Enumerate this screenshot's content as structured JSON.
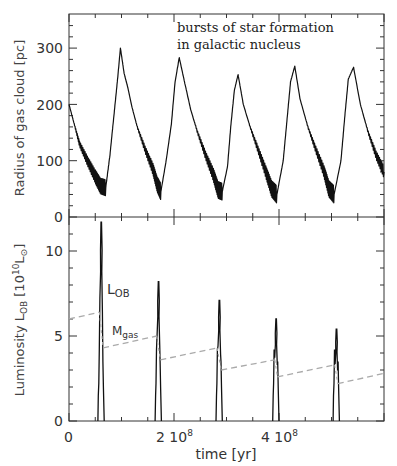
{
  "chart_data": [
    {
      "type": "line",
      "panel": "top",
      "title": "",
      "annotation": [
        "bursts of star formation",
        "in galactic nucleus"
      ],
      "xlabel": "",
      "ylabel": "Radius of gas cloud [pc]",
      "xlim": [
        0,
        600000000
      ],
      "ylim": [
        0,
        350
      ],
      "yticks": [
        0,
        100,
        200,
        300
      ],
      "ytick_labels": [
        "0",
        "100",
        "200",
        "300"
      ],
      "series": [
        {
          "name": "Radius of gas cloud",
          "style": "solid",
          "color": "#111111",
          "x_1e8": [
            0.0,
            0.1,
            0.2,
            0.35,
            0.5,
            0.6,
            0.7,
            0.78,
            0.85,
            0.92,
            0.98,
            1.05,
            1.12,
            1.2,
            1.3,
            1.45,
            1.6,
            1.68,
            1.75,
            1.85,
            1.95,
            2.02,
            2.1,
            2.2,
            2.32,
            2.45,
            2.6,
            2.75,
            2.84,
            2.92,
            3.02,
            3.08,
            3.15,
            3.22,
            3.32,
            3.45,
            3.6,
            3.75,
            3.86,
            3.96,
            4.08,
            4.15,
            4.22,
            4.3,
            4.4,
            4.55,
            4.7,
            4.86,
            4.95,
            5.05,
            5.18,
            5.25,
            5.32,
            5.42,
            5.55,
            5.7,
            5.85,
            6.0
          ],
          "y": [
            200,
            165,
            130,
            100,
            72,
            55,
            52,
            110,
            175,
            240,
            300,
            255,
            230,
            195,
            160,
            120,
            85,
            58,
            45,
            100,
            165,
            240,
            283,
            240,
            190,
            150,
            110,
            75,
            48,
            45,
            90,
            160,
            225,
            253,
            200,
            160,
            120,
            80,
            50,
            40,
            100,
            170,
            240,
            268,
            210,
            160,
            120,
            80,
            50,
            40,
            100,
            175,
            245,
            266,
            200,
            150,
            110,
            80
          ]
        }
      ]
    },
    {
      "type": "line",
      "panel": "bottom",
      "title": "",
      "xlabel": "time [yr]",
      "ylabel": "Luminosity L_OB [10^10 L_sun]",
      "xlim": [
        0,
        600000000
      ],
      "ylim": [
        0,
        12
      ],
      "xticks": [
        0,
        200000000,
        400000000
      ],
      "xtick_labels": [
        "0",
        "2 10^8",
        "4 10^8"
      ],
      "yticks": [
        0,
        5,
        10
      ],
      "ytick_labels": [
        "0",
        "5",
        "10"
      ],
      "series": [
        {
          "name": "L_OB",
          "style": "solid",
          "color": "#111111",
          "peaks_x_1e8": [
            0.61,
            1.7,
            2.86,
            3.94,
            5.09
          ],
          "peaks_y": [
            11.7,
            8.2,
            7.1,
            6.0,
            5.4
          ],
          "half_width_1e8": 0.06
        },
        {
          "name": "M_gas",
          "style": "dashed",
          "color": "#aaaaaa",
          "segments": [
            {
              "x_1e8": [
                0.0,
                0.58
              ],
              "y": [
                6.0,
                6.4
              ]
            },
            {
              "x_1e8": [
                0.65,
                1.67
              ],
              "y": [
                4.3,
                5.0
              ]
            },
            {
              "x_1e8": [
                1.74,
                2.82
              ],
              "y": [
                3.6,
                4.3
              ]
            },
            {
              "x_1e8": [
                2.9,
                3.92
              ],
              "y": [
                3.0,
                3.6
              ]
            },
            {
              "x_1e8": [
                3.97,
                5.06
              ],
              "y": [
                2.6,
                3.3
              ]
            },
            {
              "x_1e8": [
                5.12,
                6.0
              ],
              "y": [
                2.2,
                2.8
              ]
            }
          ]
        }
      ],
      "labels": {
        "lob": "L",
        "lob_sub": "OB",
        "mgas": "M",
        "mgas_sub": "gas"
      }
    }
  ],
  "axes": {
    "top_ylabel": "Radius of gas cloud [pc]",
    "bottom_ylabel_main": "Luminosity L",
    "bottom_ylabel_sub": "OB",
    "bottom_ylabel_unit_pre": "[10",
    "bottom_ylabel_unit_exp": "10",
    "bottom_ylabel_unit_L": "L",
    "bottom_ylabel_unit_sun": "⊙",
    "bottom_ylabel_unit_post": "]",
    "xlabel": "time [yr]",
    "xtick_0": "0",
    "xtick_2": "2 10",
    "xtick_4": "4 10",
    "xtick_exp": "8",
    "top_yticks": [
      "0",
      "100",
      "200",
      "300"
    ],
    "bottom_yticks": [
      "0",
      "5",
      "10"
    ]
  },
  "annotation": {
    "line1": "bursts of star formation",
    "line2": "in galactic nucleus"
  }
}
